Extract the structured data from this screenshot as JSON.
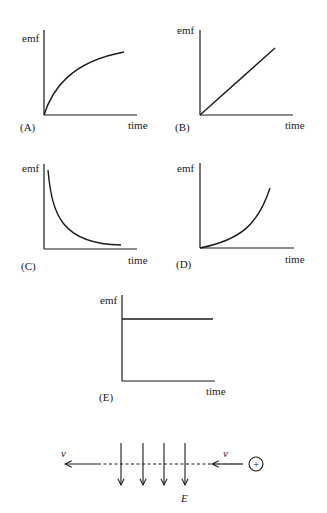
{
  "figure": {
    "graphs": [
      {
        "id": "A",
        "label": "(A)",
        "ylabel": "emf",
        "xlabel": "time",
        "shape": "concave-down rising (saturating growth)"
      },
      {
        "id": "B",
        "label": "(B)",
        "ylabel": "emf",
        "xlabel": "time",
        "shape": "linear increasing"
      },
      {
        "id": "C",
        "label": "(C)",
        "ylabel": "emf",
        "xlabel": "time",
        "shape": "decaying (inverse / exponential decay)"
      },
      {
        "id": "D",
        "label": "(D)",
        "ylabel": "emf",
        "xlabel": "time",
        "shape": "concave-up rising (accelerating growth)"
      },
      {
        "id": "E",
        "label": "(E)",
        "ylabel": "emf",
        "xlabel": "time",
        "shape": "constant"
      }
    ],
    "field_diagram": {
      "velocity_label_left": "v",
      "velocity_label_right": "v",
      "field_label": "E",
      "charge_symbol": "+",
      "field_arrow_count": 4
    },
    "colors": {
      "ink": "#1a1a1a",
      "background": "#ffffff"
    }
  }
}
